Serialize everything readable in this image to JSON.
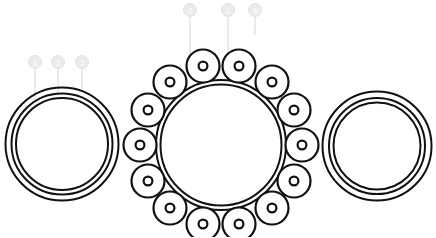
{
  "diagram": {
    "type": "technical-line-drawing",
    "canvas": {
      "width": 436,
      "height": 237
    },
    "stroke_color": "#111111",
    "background_color": "#ffffff",
    "callout_color": "#ebebeb",
    "leader_color": "#e2e2e2"
  },
  "callouts": [
    {
      "id": "1",
      "label": "1",
      "bubble_x": 35,
      "bubble_y": 62,
      "bubble_r": 6.5,
      "line_x": 35,
      "line_y1": 69,
      "line_y2": 100
    },
    {
      "id": "2",
      "label": "2",
      "bubble_x": 58,
      "bubble_y": 62,
      "bubble_r": 6.5,
      "line_x": 58,
      "line_y1": 69,
      "line_y2": 95
    },
    {
      "id": "3",
      "label": "3",
      "bubble_x": 82,
      "bubble_y": 62,
      "bubble_r": 6.5,
      "line_x": 82,
      "line_y1": 69,
      "line_y2": 89
    },
    {
      "id": "4",
      "label": "4",
      "bubble_x": 190,
      "bubble_y": 10,
      "bubble_r": 6.5,
      "line_x": 190,
      "line_y1": 17,
      "line_y2": 77
    },
    {
      "id": "5",
      "label": "5",
      "bubble_x": 228,
      "bubble_y": 10,
      "bubble_r": 6.5,
      "line_x": 228,
      "line_y1": 17,
      "line_y2": 72
    },
    {
      "id": "6",
      "label": "6",
      "bubble_x": 255,
      "bubble_y": 10,
      "bubble_r": 6.5,
      "line_x": 255,
      "line_y1": 17,
      "line_y2": 35
    }
  ],
  "left_assembly": {
    "name": "outer-race-ring-left",
    "cx": 62,
    "cy": 144,
    "rings": [
      {
        "r": 56.5,
        "stroke_width": 2
      },
      {
        "r": 50.5,
        "stroke_width": 2
      },
      {
        "r": 46.0,
        "stroke_width": 2
      }
    ]
  },
  "right_assembly": {
    "name": "outer-race-ring-right",
    "cx": 377,
    "cy": 146,
    "rings": [
      {
        "r": 54.5,
        "stroke_width": 2
      },
      {
        "r": 48.0,
        "stroke_width": 2
      },
      {
        "r": 43.5,
        "stroke_width": 2
      }
    ]
  },
  "center_assembly": {
    "name": "inner-race-with-rollers",
    "cx": 221,
    "cy": 145,
    "rings": [
      {
        "r": 65.0,
        "stroke_width": 2
      },
      {
        "r": 60.5,
        "stroke_width": 2
      }
    ],
    "roller_count": 14,
    "roller_orbit_radius": 81,
    "roller_radius": 16.5,
    "roller_hole_radius": 4.4,
    "roller_start_angle_deg": -77,
    "rollers": [
      {
        "index": 1,
        "angle_deg": -77,
        "cx": 239,
        "cy": 66
      },
      {
        "index": 2,
        "angle_deg": -51,
        "cx": 272,
        "cy": 82
      },
      {
        "index": 3,
        "angle_deg": -25,
        "cx": 294,
        "cy": 110
      },
      {
        "index": 4,
        "angle_deg": 0,
        "cx": 302,
        "cy": 145
      },
      {
        "index": 5,
        "angle_deg": 26,
        "cx": 294,
        "cy": 181
      },
      {
        "index": 6,
        "angle_deg": 51,
        "cx": 272,
        "cy": 208
      },
      {
        "index": 7,
        "angle_deg": 77,
        "cx": 239,
        "cy": 224
      },
      {
        "index": 8,
        "angle_deg": 103,
        "cx": 203,
        "cy": 224
      },
      {
        "index": 9,
        "angle_deg": 129,
        "cx": 170,
        "cy": 208
      },
      {
        "index": 10,
        "angle_deg": 154,
        "cx": 148,
        "cy": 181
      },
      {
        "index": 11,
        "angle_deg": 180,
        "cx": 140,
        "cy": 145
      },
      {
        "index": 12,
        "angle_deg": 206,
        "cx": 148,
        "cy": 110
      },
      {
        "index": 13,
        "angle_deg": 231,
        "cx": 170,
        "cy": 82
      },
      {
        "index": 14,
        "angle_deg": 257,
        "cx": 203,
        "cy": 66
      }
    ]
  }
}
